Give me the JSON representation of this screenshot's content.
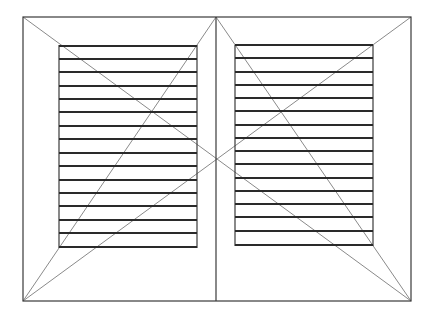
{
  "diagram": {
    "type": "line-drawing",
    "colors": {
      "background": "#ffffff",
      "frame": "#3a3a3a",
      "slat": "#2a2a2a",
      "construction": "#8a8a8a"
    },
    "outer_frame": {
      "x1": 23,
      "y1": 17,
      "x2": 411,
      "y2": 301
    },
    "center_divider": {
      "x": 216,
      "y1": 17,
      "y2": 301
    },
    "panels": [
      {
        "name": "left",
        "x1": 59,
        "y1": 45,
        "x2": 197,
        "y2": 248,
        "slats_y": [
          46,
          59,
          72,
          86,
          99,
          112,
          126,
          139,
          153,
          166,
          180,
          193,
          206,
          220,
          233,
          247
        ]
      },
      {
        "name": "right",
        "x1": 235,
        "y1": 45,
        "x2": 373,
        "y2": 246,
        "slats_y": [
          45,
          58,
          72,
          85,
          98,
          111,
          125,
          138,
          151,
          164,
          178,
          191,
          204,
          217,
          231,
          245
        ]
      }
    ],
    "construction_lines": [
      {
        "x1": 23,
        "y1": 17,
        "x2": 411,
        "y2": 301
      },
      {
        "x1": 411,
        "y1": 17,
        "x2": 23,
        "y2": 301
      },
      {
        "x1": 216,
        "y1": 17,
        "x2": 23,
        "y2": 301
      },
      {
        "x1": 216,
        "y1": 17,
        "x2": 411,
        "y2": 301
      }
    ]
  }
}
